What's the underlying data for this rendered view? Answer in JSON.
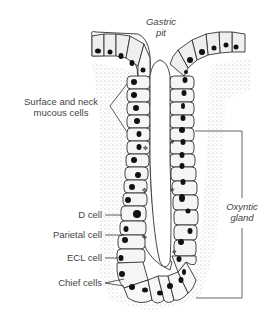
{
  "diagram": {
    "title_top": {
      "line1": "Gastric",
      "line2": "pit"
    },
    "labels": {
      "surface_mucous": {
        "line1": "Surface and neck",
        "line2": "mucous cells"
      },
      "d_cell": "D cell",
      "parietal_cell": "Parietal cell",
      "ecl_cell": "ECL cell",
      "chief_cells": "Chief cells"
    },
    "bracket_label": {
      "line1": "Oxyntic",
      "line2": "gland"
    },
    "colors": {
      "line": "#333333",
      "cell_fill": "#ededed",
      "nucleus": "#111111",
      "text": "#444444"
    }
  }
}
